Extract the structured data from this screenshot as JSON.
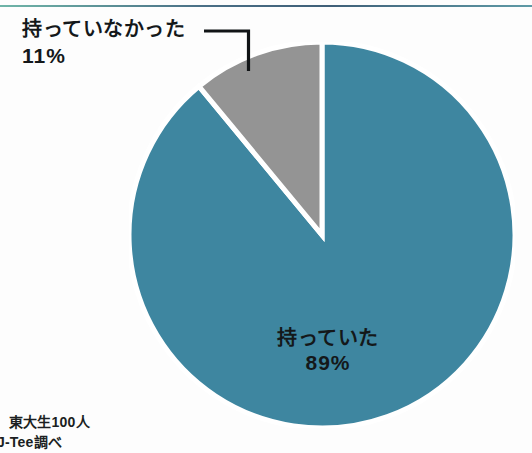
{
  "page": {
    "background_color": "#fdfdfd",
    "top_rule_color": "#4a6f86"
  },
  "chart_data": {
    "type": "pie",
    "title": "",
    "subtitle": "",
    "xlabel": "",
    "ylabel": "",
    "legend_position": "none",
    "grid": false,
    "total_percent": 100,
    "start_angle_deg": 0,
    "categories": [
      "持っていた",
      "持っていなかった"
    ],
    "values": [
      89,
      11
    ],
    "labels": [
      "持っていた 89%",
      "持っていなかった 11%"
    ],
    "colors": [
      "#3e86a0",
      "#949494"
    ],
    "separator_color": "#ffffff",
    "slices": [
      {
        "name": "持っていた",
        "label": "持っていた",
        "value": 89,
        "percent_text": "89%",
        "color": "#3e86a0",
        "label_placement": "inside",
        "direction": "clockwise-from-top"
      },
      {
        "name": "持っていなかった",
        "label": "持っていなかった",
        "value": 11,
        "percent_text": "11%",
        "color": "#949494",
        "label_placement": "outside-left",
        "direction": "counter-clockwise-from-top",
        "has_leader_line": true
      }
    ]
  },
  "labels": {
    "major": {
      "text": "持っていた",
      "percent": "89%"
    },
    "minor": {
      "text": "持っていなかった",
      "percent": "11%"
    }
  },
  "footer": {
    "line_1": "東大生100人",
    "line_2": "J-Tee調べ"
  }
}
